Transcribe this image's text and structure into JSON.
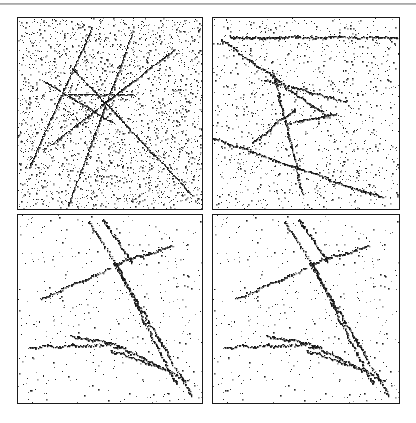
{
  "figure": {
    "title": "",
    "background_color": "#ffffff",
    "width": 416,
    "height": 423,
    "rule_color": "#9a9a9a",
    "panel_border_color": "#1a1a1a",
    "point_color": "#111111"
  },
  "panels": [
    {
      "id": "top-left",
      "label": "",
      "position": {
        "left": 17,
        "top": 17,
        "width": 186,
        "height": 193
      },
      "noise_points": 2600,
      "noise_seed": 101,
      "track_point_spacing": 0.55,
      "track_jitter": 0.9,
      "track_thickness": 1.0
    },
    {
      "id": "top-right",
      "label": "",
      "position": {
        "left": 212,
        "top": 17,
        "width": 188,
        "height": 193
      },
      "noise_points": 1250,
      "noise_seed": 202,
      "track_point_spacing": 0.75,
      "track_jitter": 1.8,
      "track_thickness": 1.25
    },
    {
      "id": "bottom-left",
      "label": "",
      "position": {
        "left": 17,
        "top": 214,
        "width": 186,
        "height": 190
      },
      "noise_points": 430,
      "noise_seed": 303,
      "track_point_spacing": 0.8,
      "track_jitter": 2.2,
      "track_thickness": 1.25
    },
    {
      "id": "bottom-right",
      "label": "",
      "position": {
        "left": 212,
        "top": 214,
        "width": 188,
        "height": 190
      },
      "noise_points": 430,
      "noise_seed": 303,
      "track_point_spacing": 0.8,
      "track_jitter": 2.2,
      "track_thickness": 1.25
    }
  ],
  "chart_data": {
    "type": "scatter",
    "title": "",
    "subtitle": "",
    "xlabel": "",
    "ylabel": "",
    "xlim": [
      0,
      1
    ],
    "ylim": [
      0,
      1
    ],
    "grid": false,
    "legend": "none",
    "axis_ticks": false,
    "series": [
      {
        "name": "top-left-noise",
        "panel": "top-left",
        "kind": "noise",
        "n_points": 2600
      },
      {
        "name": "top-left-tracks",
        "panel": "top-left",
        "kind": "tracks",
        "segments": [
          {
            "x1": 0.62,
            "y1": 0.08,
            "x2": 0.27,
            "y2": 0.98
          },
          {
            "x1": 0.4,
            "y1": 0.05,
            "x2": 0.06,
            "y2": 0.78
          },
          {
            "x1": 0.84,
            "y1": 0.17,
            "x2": 0.18,
            "y2": 0.66
          },
          {
            "x1": 0.3,
            "y1": 0.27,
            "x2": 0.95,
            "y2": 0.93
          },
          {
            "x1": 0.14,
            "y1": 0.33,
            "x2": 0.52,
            "y2": 0.55
          },
          {
            "x1": 0.23,
            "y1": 0.4,
            "x2": 0.62,
            "y2": 0.4
          }
        ]
      },
      {
        "name": "top-right-noise",
        "panel": "top-right",
        "kind": "noise",
        "n_points": 1250
      },
      {
        "name": "top-right-tracks",
        "panel": "top-right",
        "kind": "tracks",
        "segments": [
          {
            "x1": 0.09,
            "y1": 0.1,
            "x2": 0.99,
            "y2": 0.1
          },
          {
            "x1": 0.04,
            "y1": 0.11,
            "x2": 0.62,
            "y2": 0.52
          },
          {
            "x1": 0.32,
            "y1": 0.27,
            "x2": 0.48,
            "y2": 0.92
          },
          {
            "x1": 0.0,
            "y1": 0.63,
            "x2": 0.92,
            "y2": 0.94
          },
          {
            "x1": 0.26,
            "y1": 0.32,
            "x2": 0.72,
            "y2": 0.44
          },
          {
            "x1": 0.4,
            "y1": 0.55,
            "x2": 0.66,
            "y2": 0.5
          },
          {
            "x1": 0.21,
            "y1": 0.65,
            "x2": 0.44,
            "y2": 0.48
          }
        ]
      },
      {
        "name": "bottom-noise",
        "panel": "bottom-left,bottom-right",
        "kind": "noise",
        "n_points": 430
      },
      {
        "name": "bottom-tracks",
        "panel": "bottom-left,bottom-right",
        "kind": "tracks",
        "segments": [
          {
            "x1": 0.38,
            "y1": 0.03,
            "x2": 0.55,
            "y2": 0.3
          },
          {
            "x1": 0.46,
            "y1": 0.02,
            "x2": 0.62,
            "y2": 0.25
          },
          {
            "x1": 0.84,
            "y1": 0.16,
            "x2": 0.52,
            "y2": 0.26
          },
          {
            "x1": 0.52,
            "y1": 0.26,
            "x2": 0.95,
            "y2": 0.96
          },
          {
            "x1": 0.5,
            "y1": 0.28,
            "x2": 0.12,
            "y2": 0.44
          },
          {
            "x1": 0.55,
            "y1": 0.3,
            "x2": 0.86,
            "y2": 0.9
          },
          {
            "x1": 0.06,
            "y1": 0.7,
            "x2": 0.56,
            "y2": 0.69
          },
          {
            "x1": 0.28,
            "y1": 0.64,
            "x2": 0.58,
            "y2": 0.7
          },
          {
            "x1": 0.56,
            "y1": 0.7,
            "x2": 0.92,
            "y2": 0.88
          },
          {
            "x1": 0.5,
            "y1": 0.72,
            "x2": 0.8,
            "y2": 0.82
          }
        ]
      }
    ]
  }
}
